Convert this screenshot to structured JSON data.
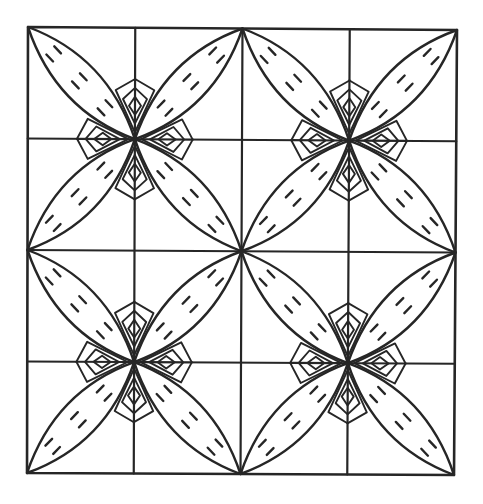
{
  "artwork": {
    "title": "",
    "description": "Line-art quilt pattern: 2x2 blocks of four-petal flowers with nested diamond motifs, on a 4x4 grid",
    "colors": {
      "line": "#262626",
      "background": "#ffffff"
    },
    "frame": {
      "top_left": [
        28,
        27
      ],
      "top_right": [
        457,
        30
      ],
      "bottom_right": [
        454,
        475
      ],
      "bottom_left": [
        27,
        473
      ]
    },
    "grid": {
      "rows": 4,
      "cols": 4
    },
    "flowers": [
      {
        "name": "flower-top-left",
        "center": [
          134,
          141
        ]
      },
      {
        "name": "flower-top-right",
        "center": [
          350,
          142
        ]
      },
      {
        "name": "flower-bottom-left",
        "center": [
          133,
          362
        ]
      },
      {
        "name": "flower-bottom-right",
        "center": [
          348,
          363
        ]
      }
    ],
    "petals_per_flower": 4,
    "dash_pairs_per_petal": 3,
    "motifs_per_flower": 4,
    "motif_nesting_levels": 3
  }
}
